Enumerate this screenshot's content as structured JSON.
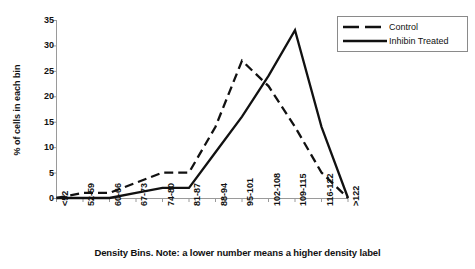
{
  "chart_data": {
    "type": "line",
    "title": "",
    "subtitle": "",
    "xlabel": "Density Bins. Note: a lower number means a higher density label",
    "ylabel": "% of cells in each bin",
    "categories": [
      "<52",
      "52-59",
      "60-66",
      "67-73",
      "74-80",
      "81-87",
      "88-94",
      "95-101",
      "102-108",
      "109-115",
      "116-122",
      ">122"
    ],
    "series": [
      {
        "name": "Control",
        "style": "dashed",
        "color": "#111111",
        "values": [
          0,
          1,
          1,
          3,
          5,
          5,
          14,
          27,
          22,
          14,
          5,
          0
        ]
      },
      {
        "name": "Inhibin Treated",
        "style": "solid",
        "color": "#111111",
        "values": [
          0,
          0,
          0,
          1,
          2,
          2,
          9,
          16,
          24,
          33,
          14,
          0
        ]
      }
    ],
    "ylim": [
      0,
      35
    ],
    "yticks": [
      0,
      5,
      10,
      15,
      20,
      25,
      30,
      35
    ],
    "ytick_labels": [
      "0",
      "5",
      "10",
      "15",
      "20",
      "25",
      "30",
      "35"
    ],
    "grid": false,
    "legend_position": "top-right"
  },
  "legend": {
    "items": [
      {
        "label": "Control"
      },
      {
        "label": "Inhibin Treated"
      }
    ]
  },
  "colors": {
    "axis": "#9a9a9a",
    "series": "#111111",
    "legend_border": "#8a8a8a",
    "background": "#ffffff"
  }
}
